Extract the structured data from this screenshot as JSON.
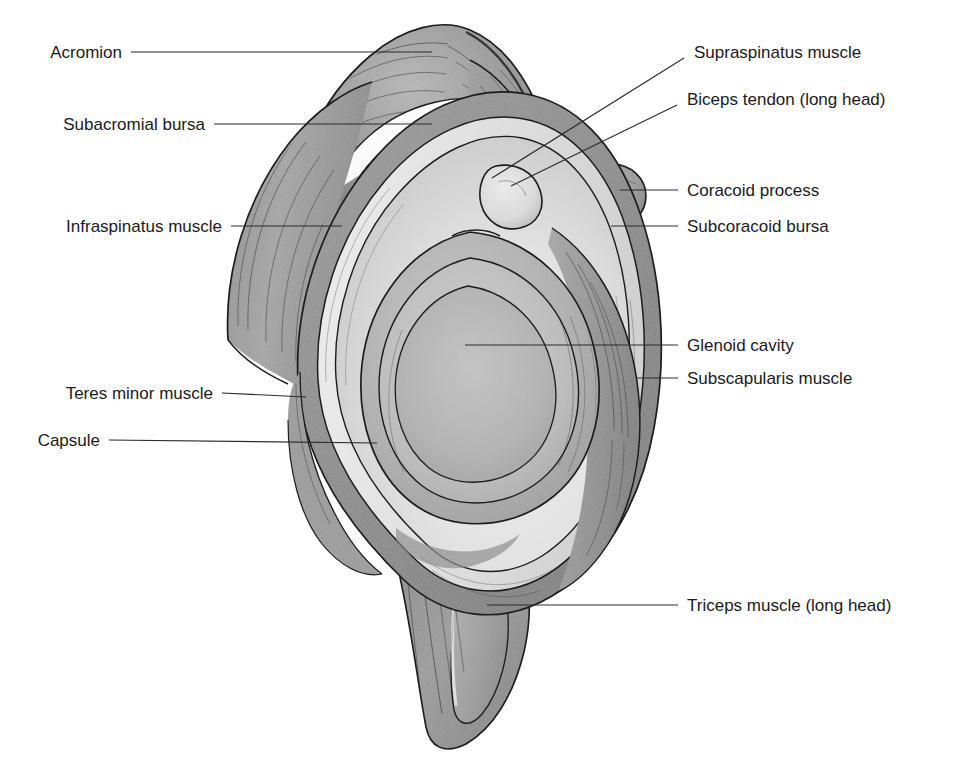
{
  "figure": {
    "view": "lateral (sagittal) section, humeral head removed",
    "style": "pencil / graphite medical illustration",
    "background_color": "#ffffff",
    "ink_color": "#1c1c1c",
    "label_color": "#1a1a1a"
  },
  "labels": [
    {
      "id": "acromion",
      "text": "Acromion",
      "side": "left",
      "text_x": 122,
      "text_y": 52,
      "leader": [
        [
          131,
          52
        ],
        [
          432,
          52
        ]
      ]
    },
    {
      "id": "subacromial-bursa",
      "text": "Subacromial bursa",
      "side": "left",
      "text_x": 205,
      "text_y": 124,
      "leader": [
        [
          214,
          124
        ],
        [
          432,
          124
        ]
      ]
    },
    {
      "id": "infraspinatus-muscle",
      "text": "Infraspinatus muscle",
      "side": "left",
      "text_x": 222,
      "text_y": 226,
      "leader": [
        [
          231,
          226
        ],
        [
          342,
          226
        ]
      ]
    },
    {
      "id": "teres-minor-muscle",
      "text": "Teres minor muscle",
      "side": "left",
      "text_x": 213,
      "text_y": 393,
      "leader": [
        [
          222,
          393
        ],
        [
          306,
          397
        ]
      ]
    },
    {
      "id": "capsule",
      "text": "Capsule",
      "side": "left",
      "text_x": 100,
      "text_y": 440,
      "leader": [
        [
          109,
          440
        ],
        [
          377,
          443
        ]
      ]
    },
    {
      "id": "supraspinatus-muscle",
      "text": "Supraspinatus muscle",
      "side": "right",
      "text_x": 694,
      "text_y": 52,
      "leader": [
        [
          684,
          58
        ],
        [
          492,
          178
        ]
      ]
    },
    {
      "id": "biceps-tendon-long-head",
      "text": "Biceps tendon (long head)",
      "side": "right",
      "text_x": 687,
      "text_y": 99,
      "leader": [
        [
          677,
          105
        ],
        [
          511,
          186
        ]
      ]
    },
    {
      "id": "coracoid-process",
      "text": "Coracoid process",
      "side": "right",
      "text_x": 687,
      "text_y": 190,
      "leader": [
        [
          678,
          190
        ],
        [
          620,
          190
        ]
      ]
    },
    {
      "id": "subcoracoid-bursa",
      "text": "Subcoracoid bursa",
      "side": "right",
      "text_x": 687,
      "text_y": 226,
      "leader": [
        [
          678,
          226
        ],
        [
          611,
          226
        ]
      ]
    },
    {
      "id": "glenoid-cavity",
      "text": "Glenoid cavity",
      "side": "right",
      "text_x": 687,
      "text_y": 345,
      "leader": [
        [
          678,
          345
        ],
        [
          465,
          345
        ]
      ]
    },
    {
      "id": "subscapularis-muscle",
      "text": "Subscapularis muscle",
      "side": "right",
      "text_x": 687,
      "text_y": 378,
      "leader": [
        [
          678,
          378
        ],
        [
          636,
          378
        ]
      ]
    },
    {
      "id": "triceps-muscle-long-head",
      "text": "Triceps muscle (long head)",
      "side": "right",
      "text_x": 687,
      "text_y": 605,
      "leader": [
        [
          678,
          605
        ],
        [
          487,
          605
        ]
      ]
    }
  ],
  "structures": {
    "acromion": "large superior bony process, top of figure",
    "subacromial_bursa": "thin crescent space beneath acromion",
    "supraspinatus_muscle": "band running from superior-medial toward coracoid",
    "biceps_tendon_long_head": "small pale oval at superior glenoid rim",
    "coracoid_process": "rounded knob on right superior margin",
    "subcoracoid_bursa": "small dark ring beneath coracoid",
    "glenoid_cavity": "central pear-shaped articular fossa",
    "infraspinatus_muscle": "muscle layer on left posterior border",
    "teres_minor_muscle": "narrow strip below infraspinatus on left",
    "capsule": "fibrous ring encircling the glenoid",
    "subscapularis_muscle": "broad band on right anterior border",
    "triceps_muscle_long_head": "tongue-shaped process descending inferiorly"
  }
}
